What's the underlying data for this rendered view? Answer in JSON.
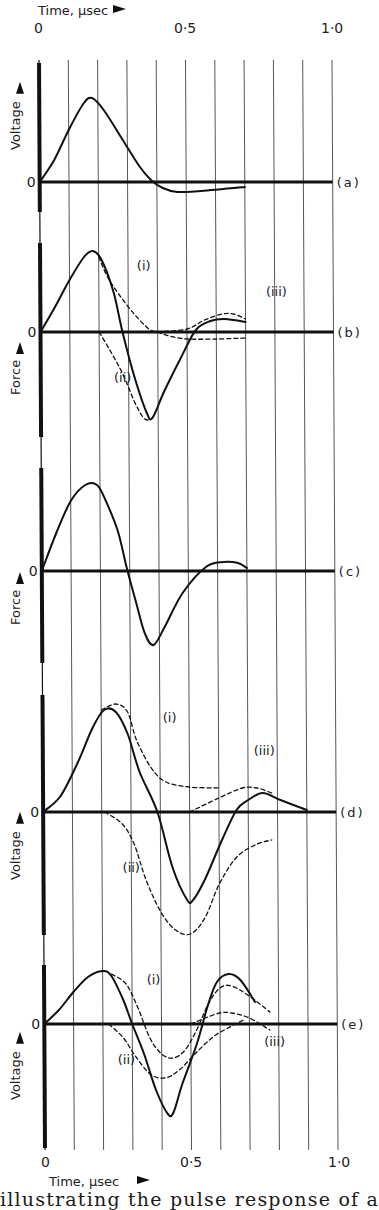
{
  "figure": {
    "top_axis_label": "Time, μsec",
    "bottom_axis_label": "Time, μsec",
    "x_ticks": [
      {
        "t": 0,
        "label": "0"
      },
      {
        "t": 0.5,
        "label": "0·5"
      },
      {
        "t": 1.0,
        "label": "1·0"
      }
    ],
    "caption": "illustrating the pulse response of a"
  },
  "chart_data": {
    "type": "line",
    "title": "",
    "xlabel": "Time, μsec",
    "xlim": [
      0,
      1.0
    ],
    "x_ticks": [
      0,
      0.5,
      1.0
    ],
    "grid": "vertical lines every 0.1 μsec",
    "legend": "none (curves labelled inline (i), (ii), (iii))",
    "y_units": "arbitrary (relative amplitude, + above zero line)",
    "panels": [
      {
        "id": "a",
        "label": "(a)",
        "ylabel": "Voltage",
        "zero_label": "0",
        "series": [
          {
            "name": "main",
            "style": "solid",
            "points": [
              [
                0,
                0
              ],
              [
                0.05,
                22
              ],
              [
                0.1,
                52
              ],
              [
                0.15,
                78
              ],
              [
                0.18,
                84
              ],
              [
                0.22,
                72
              ],
              [
                0.28,
                44
              ],
              [
                0.34,
                16
              ],
              [
                0.38,
                2
              ],
              [
                0.42,
                -6
              ],
              [
                0.47,
                -10
              ],
              [
                0.55,
                -9
              ],
              [
                0.7,
                -5
              ]
            ]
          }
        ]
      },
      {
        "id": "b",
        "label": "(b)",
        "ylabel": "Force",
        "zero_label": "0",
        "series": [
          {
            "name": "main",
            "style": "solid",
            "points": [
              [
                0,
                0
              ],
              [
                0.05,
                25
              ],
              [
                0.1,
                52
              ],
              [
                0.15,
                75
              ],
              [
                0.18,
                81
              ],
              [
                0.21,
                72
              ],
              [
                0.25,
                40
              ],
              [
                0.28,
                0
              ],
              [
                0.32,
                -45
              ],
              [
                0.36,
                -80
              ],
              [
                0.38,
                -86
              ],
              [
                0.42,
                -60
              ],
              [
                0.48,
                -25
              ],
              [
                0.53,
                2
              ],
              [
                0.58,
                11
              ],
              [
                0.63,
                13
              ],
              [
                0.7,
                10
              ]
            ]
          },
          {
            "name": "(i)",
            "style": "dashed",
            "points": [
              [
                0.2,
                75
              ],
              [
                0.23,
                55
              ],
              [
                0.27,
                37
              ],
              [
                0.32,
                18
              ],
              [
                0.37,
                3
              ],
              [
                0.4,
                0
              ],
              [
                0.44,
                -4
              ],
              [
                0.5,
                -7
              ],
              [
                0.6,
                -7
              ],
              [
                0.7,
                -6
              ]
            ]
          },
          {
            "name": "(ii)",
            "style": "dashed",
            "points": [
              [
                0.2,
                0
              ],
              [
                0.24,
                -20
              ],
              [
                0.28,
                -42
              ],
              [
                0.32,
                -70
              ],
              [
                0.35,
                -86
              ],
              [
                0.37,
                -88
              ]
            ]
          },
          {
            "name": "(iii)",
            "style": "dashed",
            "points": [
              [
                0.4,
                0
              ],
              [
                0.5,
                3
              ],
              [
                0.56,
                12
              ],
              [
                0.62,
                18
              ],
              [
                0.66,
                18
              ],
              [
                0.7,
                13
              ]
            ]
          }
        ],
        "annotations": [
          {
            "text": "(i)",
            "t": 0.33,
            "v": 62
          },
          {
            "text": "(ii)",
            "t": 0.25,
            "v": -50
          },
          {
            "text": "(iii)",
            "t": 0.77,
            "v": 36
          }
        ]
      },
      {
        "id": "c",
        "label": "(c)",
        "ylabel": "Force",
        "zero_label": "0",
        "series": [
          {
            "name": "main",
            "style": "solid",
            "points": [
              [
                0,
                0
              ],
              [
                0.05,
                38
              ],
              [
                0.1,
                70
              ],
              [
                0.15,
                86
              ],
              [
                0.19,
                86
              ],
              [
                0.22,
                70
              ],
              [
                0.26,
                40
              ],
              [
                0.29,
                3
              ],
              [
                0.32,
                -30
              ],
              [
                0.35,
                -62
              ],
              [
                0.38,
                -74
              ],
              [
                0.42,
                -55
              ],
              [
                0.48,
                -22
              ],
              [
                0.56,
                4
              ],
              [
                0.62,
                9
              ],
              [
                0.67,
                8
              ],
              [
                0.7,
                3
              ]
            ]
          }
        ]
      },
      {
        "id": "d",
        "label": "(d)",
        "ylabel": "Voltage",
        "zero_label": "0",
        "series": [
          {
            "name": "main",
            "style": "solid",
            "points": [
              [
                0,
                0
              ],
              [
                0.06,
                16
              ],
              [
                0.12,
                50
              ],
              [
                0.17,
                84
              ],
              [
                0.21,
                102
              ],
              [
                0.25,
                100
              ],
              [
                0.29,
                78
              ],
              [
                0.33,
                40
              ],
              [
                0.39,
                0
              ],
              [
                0.44,
                -55
              ],
              [
                0.49,
                -88
              ],
              [
                0.51,
                -88
              ],
              [
                0.55,
                -68
              ],
              [
                0.61,
                -28
              ],
              [
                0.66,
                2
              ],
              [
                0.7,
                12
              ],
              [
                0.75,
                19
              ],
              [
                0.81,
                12
              ],
              [
                0.9,
                2
              ]
            ]
          },
          {
            "name": "(i)",
            "style": "dashed",
            "points": [
              [
                0.2,
                102
              ],
              [
                0.25,
                108
              ],
              [
                0.29,
                100
              ],
              [
                0.32,
                72
              ],
              [
                0.37,
                44
              ],
              [
                0.42,
                30
              ],
              [
                0.5,
                25
              ],
              [
                0.6,
                24
              ]
            ]
          },
          {
            "name": "(ii)",
            "style": "dashed",
            "points": [
              [
                0.21,
                0
              ],
              [
                0.27,
                -12
              ],
              [
                0.31,
                -32
              ],
              [
                0.35,
                -68
              ],
              [
                0.4,
                -100
              ],
              [
                0.45,
                -118
              ],
              [
                0.5,
                -122
              ],
              [
                0.55,
                -106
              ],
              [
                0.6,
                -72
              ],
              [
                0.66,
                -45
              ],
              [
                0.73,
                -32
              ],
              [
                0.78,
                -28
              ]
            ]
          },
          {
            "name": "(iii)",
            "style": "dashed",
            "points": [
              [
                0.5,
                0
              ],
              [
                0.6,
                14
              ],
              [
                0.68,
                24
              ],
              [
                0.73,
                24
              ],
              [
                0.78,
                19
              ]
            ]
          }
        ],
        "annotations": [
          {
            "text": "(i)",
            "t": 0.41,
            "v": 90
          },
          {
            "text": "(ii)",
            "t": 0.27,
            "v": -60
          },
          {
            "text": "(iii)",
            "t": 0.72,
            "v": 57
          }
        ]
      },
      {
        "id": "e",
        "label": "(e)",
        "ylabel": "Voltage",
        "zero_label": "0",
        "series": [
          {
            "name": "main",
            "style": "solid",
            "points": [
              [
                0,
                0
              ],
              [
                0.05,
                14
              ],
              [
                0.1,
                32
              ],
              [
                0.15,
                47
              ],
              [
                0.2,
                53
              ],
              [
                0.23,
                48
              ],
              [
                0.27,
                24
              ],
              [
                0.3,
                0
              ],
              [
                0.34,
                -30
              ],
              [
                0.38,
                -66
              ],
              [
                0.42,
                -90
              ],
              [
                0.44,
                -88
              ],
              [
                0.47,
                -60
              ],
              [
                0.52,
                -20
              ],
              [
                0.56,
                20
              ],
              [
                0.59,
                42
              ],
              [
                0.63,
                50
              ],
              [
                0.67,
                44
              ],
              [
                0.72,
                22
              ]
            ]
          },
          {
            "name": "(i)",
            "style": "dashed",
            "points": [
              [
                0.23,
                50
              ],
              [
                0.28,
                40
              ],
              [
                0.32,
                16
              ],
              [
                0.36,
                -14
              ],
              [
                0.4,
                -30
              ],
              [
                0.44,
                -34
              ],
              [
                0.48,
                -26
              ],
              [
                0.52,
                -6
              ],
              [
                0.56,
                20
              ],
              [
                0.6,
                36
              ],
              [
                0.64,
                38
              ],
              [
                0.7,
                28
              ],
              [
                0.77,
                12
              ]
            ]
          },
          {
            "name": "(ii)",
            "style": "dashed",
            "points": [
              [
                0.22,
                0
              ],
              [
                0.27,
                -14
              ],
              [
                0.31,
                -32
              ],
              [
                0.36,
                -50
              ],
              [
                0.41,
                -54
              ],
              [
                0.46,
                -46
              ],
              [
                0.52,
                -28
              ],
              [
                0.58,
                -12
              ],
              [
                0.64,
                -2
              ],
              [
                0.68,
                4
              ]
            ]
          },
          {
            "name": "(iii)",
            "style": "dashed",
            "points": [
              [
                0.5,
                0
              ],
              [
                0.55,
                6
              ],
              [
                0.6,
                11
              ],
              [
                0.64,
                11
              ],
              [
                0.7,
                6
              ],
              [
                0.77,
                -6
              ]
            ]
          }
        ],
        "annotations": [
          {
            "text": "(i)",
            "t": 0.35,
            "v": 40
          },
          {
            "text": "(ii)",
            "t": 0.25,
            "v": -40
          },
          {
            "text": "(iii)",
            "t": 0.75,
            "v": -22
          }
        ]
      }
    ]
  },
  "layout": {
    "x_origin_top": 39,
    "x_origin_bottom": 45,
    "y_top": 60,
    "y_bottom": 1150,
    "px_per_unit_t": 293,
    "panel_baselines": {
      "a": 182,
      "b": 332,
      "c": 571,
      "d": 812,
      "e": 1024
    },
    "axis_segments": [
      [
        63,
        212
      ],
      [
        243,
        437
      ],
      [
        468,
        663
      ],
      [
        695,
        935
      ],
      [
        965,
        1148
      ]
    ],
    "axis_color": "#111111",
    "grid_color": "#555555"
  }
}
